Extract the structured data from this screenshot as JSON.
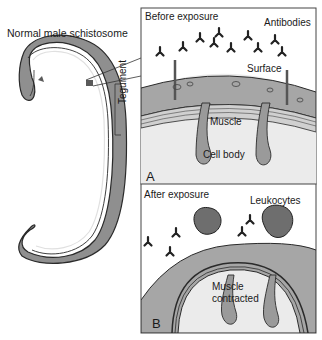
{
  "figure": {
    "title": "Normal male schistosome",
    "callout_label": "Tegument"
  },
  "panel_a": {
    "title": "Before exposure",
    "letter": "A",
    "labels": {
      "antibodies": "Antibodies",
      "surface": "Surface",
      "muscle": "Muscle",
      "cell_body": "Cell body"
    }
  },
  "panel_b": {
    "title": "After exposure",
    "letter": "B",
    "labels": {
      "leukocytes": "Leukocytes",
      "muscle_line1": "Muscle",
      "muscle_line2": "contracted"
    }
  },
  "colors": {
    "panel_bg": "#ebebeb",
    "tegument_fill": "#a6a6a6",
    "cell_fill": "#9a9a9a",
    "leukocyte_fill": "#6e6e6e",
    "outline": "#2a2a2a",
    "worm_fill": "#8f8f8f"
  }
}
